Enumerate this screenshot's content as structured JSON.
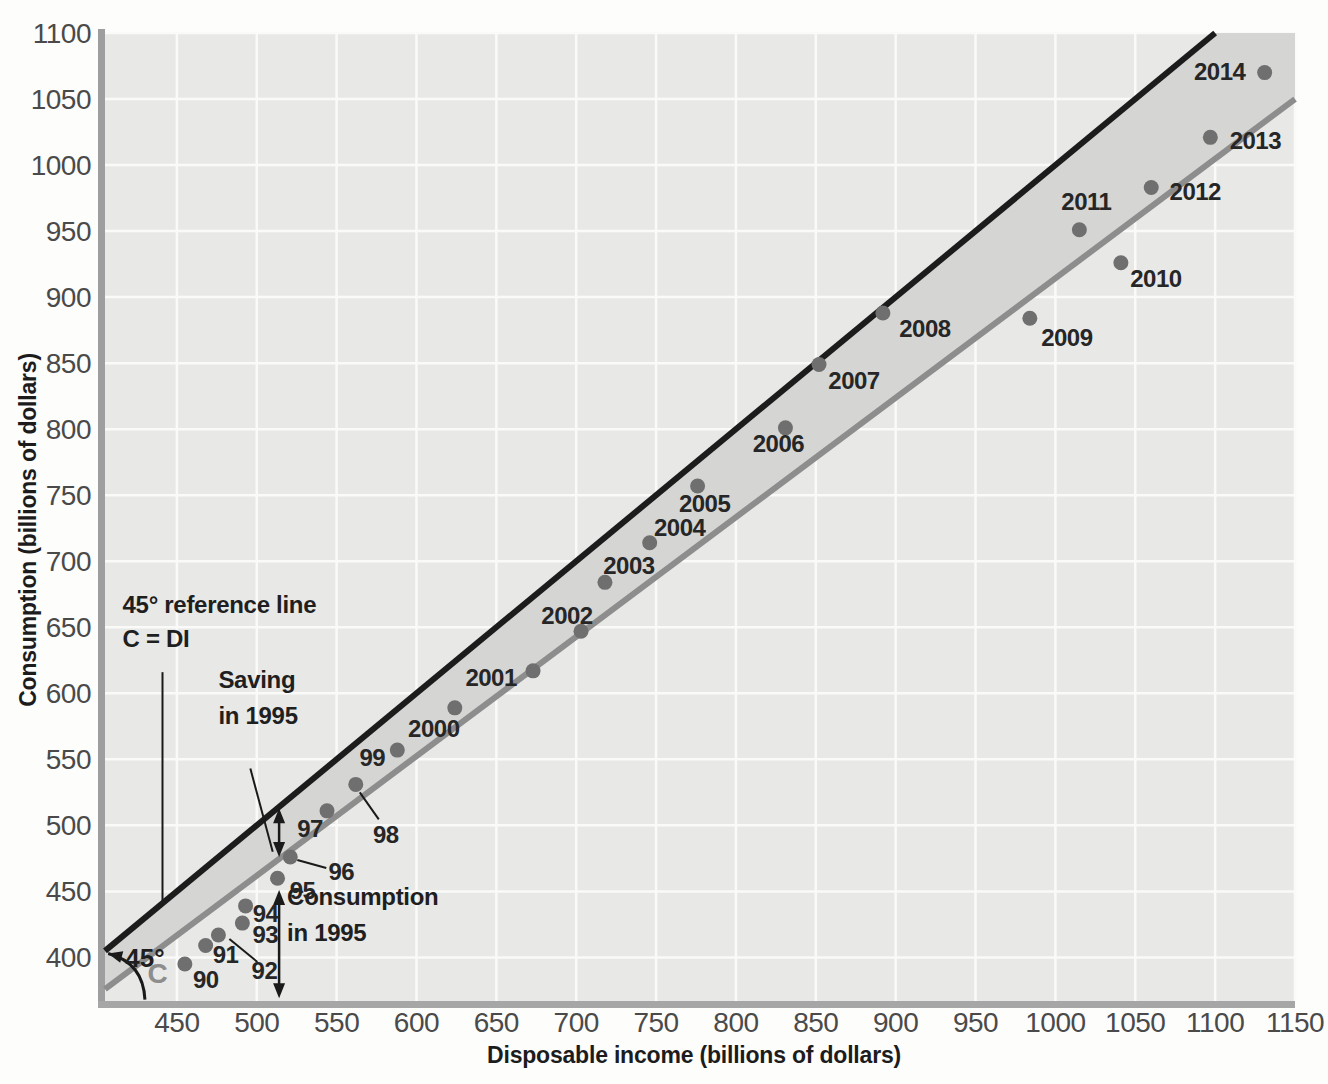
{
  "page": {
    "background": "#fdfdfc"
  },
  "chart_data": {
    "type": "scatter",
    "title": "",
    "xlabel": "Disposable income (billions of dollars)",
    "ylabel": "Consumption (billions of dollars)",
    "x_ticks": [
      450,
      500,
      550,
      600,
      650,
      700,
      750,
      800,
      850,
      900,
      950,
      1000,
      1050,
      1100,
      1150
    ],
    "y_ticks": [
      400,
      450,
      500,
      550,
      600,
      650,
      700,
      750,
      800,
      850,
      900,
      950,
      1000,
      1050,
      1100
    ],
    "xlim": [
      405,
      1150
    ],
    "ylim": [
      367,
      1100
    ],
    "grid": true,
    "legend": "none",
    "colors": {
      "plot_bg": "#e8e8e7",
      "band": "#d5d5d4",
      "grid": "#fafaf9",
      "reference_line": "#1c1c1c",
      "consumption_line": "#8d8d8d",
      "dot": "#6f6f6f",
      "left_border": "#9e9e9e",
      "bottom_border": "#a6a6a6",
      "annotation_ink": "#1a1a1a"
    },
    "reference_line": {
      "equation": "C = DI",
      "from": [
        405,
        405
      ],
      "to": [
        1100,
        1100
      ]
    },
    "consumption_line": {
      "label": "C",
      "from": [
        405,
        376
      ],
      "to": [
        1150,
        1050
      ]
    },
    "points": [
      {
        "label": "90",
        "di": 455,
        "c": 395,
        "dx": 21,
        "dy": 16
      },
      {
        "label": "91",
        "di": 468,
        "c": 409,
        "dx": 20,
        "dy": 9
      },
      {
        "label": "92",
        "di": 476,
        "c": 417,
        "dx": 46,
        "dy": 36,
        "leader": [
          11,
          4,
          39,
          27
        ]
      },
      {
        "label": "93",
        "di": 491,
        "c": 426,
        "dx": 23,
        "dy": 12
      },
      {
        "label": "94",
        "di": 493,
        "c": 439,
        "dx": 20,
        "dy": 8
      },
      {
        "label": "95",
        "di": 513,
        "c": 460,
        "dx": 25,
        "dy": 13
      },
      {
        "label": "96",
        "di": 521,
        "c": 476,
        "dx": 51,
        "dy": 15,
        "leader": [
          7,
          3,
          36,
          11
        ]
      },
      {
        "label": "97",
        "di": 544,
        "c": 511,
        "dx": -17,
        "dy": 18
      },
      {
        "label": "98",
        "di": 562,
        "c": 531,
        "dx": 30,
        "dy": 51,
        "leader": [
          4,
          8,
          23,
          35
        ]
      },
      {
        "label": "99",
        "di": 588,
        "c": 557,
        "dx": -25,
        "dy": 8
      },
      {
        "label": "2000",
        "di": 624,
        "c": 589,
        "dx": -21,
        "dy": 21
      },
      {
        "label": "2001",
        "di": 673,
        "c": 617,
        "dx": -42,
        "dy": 7
      },
      {
        "label": "2002",
        "di": 703,
        "c": 647,
        "dx": -14,
        "dy": -15
      },
      {
        "label": "2003",
        "di": 718,
        "c": 684,
        "dx": 24,
        "dy": -16
      },
      {
        "label": "2004",
        "di": 746,
        "c": 714,
        "dx": 30,
        "dy": -15
      },
      {
        "label": "2005",
        "di": 776,
        "c": 757,
        "dx": 7,
        "dy": 18
      },
      {
        "label": "2006",
        "di": 831,
        "c": 801,
        "dx": -7,
        "dy": 16
      },
      {
        "label": "2007",
        "di": 852,
        "c": 849,
        "dx": 35,
        "dy": 17
      },
      {
        "label": "2008",
        "di": 892,
        "c": 888,
        "dx": 42,
        "dy": 16
      },
      {
        "label": "2009",
        "di": 984,
        "c": 884,
        "dx": 37,
        "dy": 20
      },
      {
        "label": "2010",
        "di": 1041,
        "c": 926,
        "dx": 35,
        "dy": 16
      },
      {
        "label": "2011",
        "di": 1015,
        "c": 951,
        "dx": 7,
        "dy": -28
      },
      {
        "label": "2012",
        "di": 1060,
        "c": 983,
        "dx": 44,
        "dy": 4
      },
      {
        "label": "2013",
        "di": 1097,
        "c": 1021,
        "dx": 45,
        "dy": 4
      },
      {
        "label": "2014",
        "di": 1131,
        "c": 1070,
        "dx": -45,
        "dy": -1
      }
    ],
    "annotations": {
      "reference_label": {
        "lines": [
          "45° reference line",
          "C = DI"
        ],
        "x": 416,
        "y": 653
      },
      "reference_pointer": {
        "from": [
          441,
          616
        ],
        "to": [
          441,
          443
        ]
      },
      "saving_label": {
        "lines": [
          "Saving",
          "in 1995"
        ],
        "x": 476,
        "y": 572
      },
      "saving_pointer": {
        "from": [
          496,
          543
        ],
        "to": [
          510,
          480
        ]
      },
      "saving_arrow": {
        "x": 514,
        "c_top": 513,
        "c_bottom": 476
      },
      "consumption_label": {
        "lines": [
          "Consumption",
          "in 1995"
        ],
        "x": 519,
        "y": 408
      },
      "consumption_arrow": {
        "x": 514,
        "c_top": 451,
        "c_bottom": 369
      },
      "angle_label": {
        "text": "45°",
        "x": 430,
        "y": 393
      },
      "angle_arc": {
        "start": [
          430,
          368
        ],
        "control": [
          429,
          396
        ],
        "end": [
          407,
          403
        ]
      },
      "c_line_label": {
        "text": "C",
        "x": 438,
        "y": 381
      }
    }
  }
}
